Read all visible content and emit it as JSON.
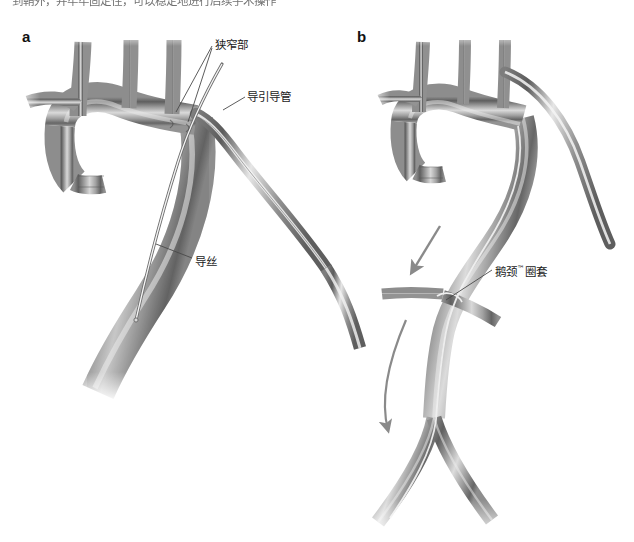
{
  "page": {
    "cropped_body_text": "到鞘外，并牢牢固定住，可以稳定地进行后续手术操作"
  },
  "figure": {
    "panels": [
      {
        "letter": "a",
        "name": "panel-a-aortic-arch-guidewire",
        "labels": [
          {
            "id": "stenosis",
            "text": "狭窄部",
            "leader_count": 2
          },
          {
            "id": "guiding-catheter",
            "text": "导引导管",
            "leader_count": 1
          },
          {
            "id": "guidewire",
            "text": "导丝",
            "leader_count": 1
          }
        ]
      },
      {
        "letter": "b",
        "name": "panel-b-snare-retrieval",
        "labels": [
          {
            "id": "snare",
            "text_before_tm": "鹅颈",
            "tm": "™",
            "text_after_tm": "圈套",
            "leader_count": 1
          }
        ],
        "arrows": [
          {
            "id": "arrow-antegrade-down",
            "direction": "down-left",
            "style": "straight"
          },
          {
            "id": "arrow-retrograde-sweep",
            "direction": "down",
            "style": "curved"
          }
        ]
      }
    ]
  },
  "colors": {
    "vessel_dark": "#6d6d6d",
    "vessel_mid": "#9a9a9a",
    "vessel_light": "#d6d6d6",
    "vessel_outline": "#5a5a5a",
    "lumen_highlight": "#f2f2f2",
    "device_metal": "#b9b9b9",
    "device_outline": "#7a7a7a",
    "leader_line": "#4a4a4a",
    "arrow_fill": "#8a8a8a",
    "background": "#ffffff",
    "text": "#1b1b1b"
  }
}
